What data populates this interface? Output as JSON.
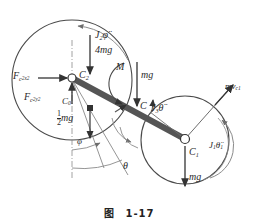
{
  "figure": {
    "caption_zh": "图",
    "caption_num": "1-17",
    "type": "free-body-diagram"
  },
  "geometry": {
    "big_circle": {
      "cx": 72,
      "cy": 80,
      "r": 60,
      "name": "body-2-circle"
    },
    "small_circle": {
      "cx": 185,
      "cy": 140,
      "r": 44,
      "name": "body-1-circle"
    },
    "bar": {
      "x1": 72,
      "y1": 78,
      "x2": 185,
      "y2": 139,
      "width": 6
    },
    "vertical_axis": {
      "x": 72,
      "y1": 40,
      "y2": 178
    }
  },
  "points": {
    "c2": "C",
    "c2_sub": "2",
    "c0": "C",
    "c0_sub": "0",
    "c": "C",
    "c1": "C",
    "c1_sub": "1"
  },
  "labels": {
    "inertia_couple_2": {
      "base": "J",
      "sub": "2",
      "var": "φ̈"
    },
    "weight_4mg": "4mg",
    "force_x": {
      "base": "F",
      "sub": "c",
      "sub2": "2x2"
    },
    "force_y": {
      "base": "F",
      "sub": "c",
      "sub2": "2y2"
    },
    "half_mg_num": "1",
    "half_mg_den": "2",
    "half_mg_unit": "mg",
    "couple_M": "M",
    "weight_mg_mid": "mg",
    "inertia_couple_3": {
      "base": "J",
      "sub": "3",
      "var": "θ̈"
    },
    "momentum_mvc1": {
      "base": "mv",
      "sub": "c1"
    },
    "inertia_couple_1": {
      "base": "J",
      "sub": "1",
      "var": "θ̈",
      "sub_tail": "1"
    },
    "weight_mg_bottom": "mg",
    "angle_phi": "φ",
    "angle_theta": "θ"
  },
  "colors": {
    "ink": "#2a2a2a",
    "bar": "#555555",
    "thin_line": "#6d6d6d",
    "arc": "#8a8a8a",
    "background": "#ffffff"
  }
}
